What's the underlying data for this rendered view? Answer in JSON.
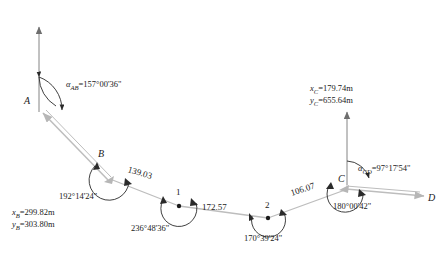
{
  "figure": {
    "type": "surveying-traverse-diagram"
  },
  "points": {
    "A": {
      "label": "A"
    },
    "B": {
      "label": "B"
    },
    "one": {
      "label": "1"
    },
    "two": {
      "label": "2"
    },
    "C": {
      "label": "C"
    },
    "D": {
      "label": "D"
    }
  },
  "bearings": {
    "AB": {
      "symbol": "α",
      "subscript": "AB",
      "equals": "=",
      "value": "157°00'36\"",
      "full": "αAB=157°00'36\""
    },
    "CD": {
      "symbol": "α",
      "subscript": "CD",
      "equals": "=",
      "value": "97°17'54\"",
      "full": "αCD=97°17'54\""
    }
  },
  "angles": [
    {
      "at": "B",
      "value": "192°14'24\""
    },
    {
      "at": "1",
      "value": "236°48'36\""
    },
    {
      "at": "2",
      "value": "170°39'24\""
    },
    {
      "at": "C",
      "value": "180°00'42\""
    }
  ],
  "distances": [
    {
      "from": "B",
      "to": "1",
      "value": "139.03"
    },
    {
      "from": "1",
      "to": "2",
      "value": "172.57"
    },
    {
      "from": "2",
      "to": "C",
      "value": "106.07"
    }
  ],
  "coordinates": {
    "B": {
      "x_symbol": "x",
      "x_sub": "B",
      "x_value": "=299.82m",
      "y_symbol": "y",
      "y_sub": "B",
      "y_value": "=303.80m"
    },
    "C": {
      "x_symbol": "x",
      "x_sub": "C",
      "x_value": "=179.74m",
      "y_symbol": "y",
      "y_sub": "C",
      "y_value": "=655.64m"
    }
  },
  "colors": {
    "line": "#b8b8b8",
    "text": "#1a1a1a",
    "arc": "#2a2a2a",
    "axis": "#707070"
  }
}
